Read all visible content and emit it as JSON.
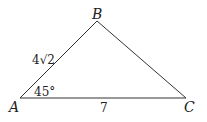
{
  "figure": {
    "type": "triangle",
    "vertices": {
      "A": {
        "label": "A",
        "x": 20,
        "y": 98
      },
      "B": {
        "label": "B",
        "x": 97,
        "y": 21
      },
      "C": {
        "label": "C",
        "x": 186,
        "y": 98
      }
    },
    "side_AB_label": "4√2",
    "side_AC_label": "7",
    "angle_A_label": "45°",
    "line_color": "#333333"
  }
}
